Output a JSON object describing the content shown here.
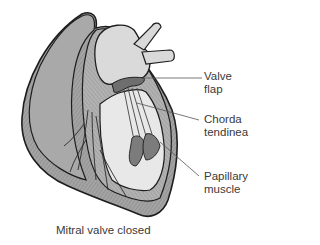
{
  "figure": {
    "caption": "Mitral valve closed"
  },
  "labels": [
    {
      "line1": "Valve",
      "line2": "flap"
    },
    {
      "line1": "Chorda",
      "line2": "tendinea"
    },
    {
      "line1": "Papillary",
      "line2": "muscle"
    }
  ],
  "colors": {
    "outline": "#1e1e1e",
    "muscle": "#9a9a9a",
    "muscle_light": "#b9b9b9",
    "chamber": "#e6e6e6",
    "papillary": "#7c7c7c",
    "leader": "#555555",
    "text": "#3a3a3a"
  }
}
